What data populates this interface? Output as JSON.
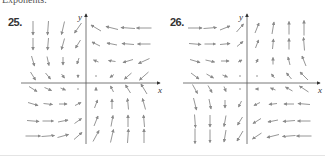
{
  "header": {
    "cut_text": "Exponents."
  },
  "colors": {
    "arrow": "#8a8a8a",
    "axis": "#555555",
    "label": "#333333"
  },
  "chart_data": [
    {
      "type": "vector_field",
      "title": "25.",
      "xlabel": "x",
      "ylabel": "y",
      "origin_px": [
        86,
        83
      ],
      "grid_x_px": [
        33,
        48,
        63,
        78,
        96,
        112,
        128,
        144
      ],
      "grid_y_px": [
        28,
        44,
        61,
        76,
        89,
        104,
        121,
        136
      ],
      "vectors": [
        [
          [
            0,
            14
          ],
          [
            -1,
            14
          ],
          [
            -3,
            13
          ],
          [
            -7,
            10
          ],
          [
            -10,
            -6
          ],
          [
            -12,
            -3
          ],
          [
            -14,
            -1
          ],
          [
            -15,
            0
          ]
        ],
        [
          [
            0,
            12
          ],
          [
            -1,
            12
          ],
          [
            -3,
            11
          ],
          [
            -5,
            8
          ],
          [
            -8,
            -4
          ],
          [
            -10,
            -2
          ],
          [
            -12,
            -1
          ],
          [
            -13,
            0
          ]
        ],
        [
          [
            3,
            10
          ],
          [
            2,
            9
          ],
          [
            0,
            8
          ],
          [
            -2,
            6
          ],
          [
            -5,
            -2
          ],
          [
            -7,
            -1
          ],
          [
            -10,
            3
          ],
          [
            -11,
            5
          ]
        ],
        [
          [
            5,
            8
          ],
          [
            5,
            6
          ],
          [
            3,
            4
          ],
          [
            0,
            3
          ],
          [
            -2,
            0
          ],
          [
            -4,
            3
          ],
          [
            -7,
            6
          ],
          [
            -9,
            8
          ]
        ],
        [
          [
            8,
            5
          ],
          [
            7,
            3
          ],
          [
            5,
            2
          ],
          [
            2,
            0
          ],
          [
            0,
            -3
          ],
          [
            -3,
            -6
          ],
          [
            -5,
            -8
          ],
          [
            -6,
            -10
          ]
        ],
        [
          [
            10,
            3
          ],
          [
            9,
            1
          ],
          [
            8,
            0
          ],
          [
            6,
            -3
          ],
          [
            3,
            -8
          ],
          [
            0,
            -10
          ],
          [
            -1,
            -11
          ],
          [
            -3,
            -11
          ]
        ],
        [
          [
            12,
            1
          ],
          [
            11,
            0
          ],
          [
            10,
            -2
          ],
          [
            7,
            -5
          ],
          [
            4,
            -10
          ],
          [
            2,
            -11
          ],
          [
            0,
            -12
          ],
          [
            -1,
            -12
          ]
        ],
        [
          [
            15,
            0
          ],
          [
            13,
            -1
          ],
          [
            11,
            -3
          ],
          [
            8,
            -7
          ],
          [
            6,
            -11
          ],
          [
            3,
            -13
          ],
          [
            1,
            -14
          ],
          [
            0,
            -14
          ]
        ]
      ]
    },
    {
      "type": "vector_field",
      "title": "26.",
      "xlabel": "x",
      "ylabel": "y",
      "origin_px": [
        247,
        83
      ],
      "grid_x_px": [
        195,
        210,
        225,
        240,
        257,
        273,
        289,
        304
      ],
      "grid_y_px": [
        28,
        44,
        61,
        76,
        89,
        104,
        121,
        136
      ],
      "vectors": [
        [
          [
            14,
            0
          ],
          [
            13,
            -1
          ],
          [
            10,
            -4
          ],
          [
            7,
            -8
          ],
          [
            4,
            -10
          ],
          [
            2,
            -12
          ],
          [
            0,
            -13
          ],
          [
            0,
            -15
          ]
        ],
        [
          [
            12,
            1
          ],
          [
            11,
            0
          ],
          [
            10,
            -1
          ],
          [
            6,
            -5
          ],
          [
            3,
            -8
          ],
          [
            1,
            -10
          ],
          [
            0,
            -11
          ],
          [
            -1,
            -13
          ]
        ],
        [
          [
            10,
            3
          ],
          [
            9,
            2
          ],
          [
            8,
            0
          ],
          [
            4,
            -2
          ],
          [
            2,
            -4
          ],
          [
            0,
            -7
          ],
          [
            -2,
            -8
          ],
          [
            -4,
            -10
          ]
        ],
        [
          [
            8,
            6
          ],
          [
            7,
            4
          ],
          [
            5,
            2
          ],
          [
            2,
            0
          ],
          [
            0,
            -2
          ],
          [
            -3,
            -4
          ],
          [
            -5,
            -6
          ],
          [
            -8,
            -8
          ]
        ],
        [
          [
            5,
            9
          ],
          [
            4,
            7
          ],
          [
            2,
            5
          ],
          [
            0,
            2
          ],
          [
            -3,
            0
          ],
          [
            -5,
            -2
          ],
          [
            -7,
            -4
          ],
          [
            -9,
            -6
          ]
        ],
        [
          [
            3,
            12
          ],
          [
            2,
            10
          ],
          [
            0,
            8
          ],
          [
            -3,
            6
          ],
          [
            -6,
            3
          ],
          [
            -8,
            1
          ],
          [
            -10,
            0
          ],
          [
            -12,
            -1
          ]
        ],
        [
          [
            1,
            13
          ],
          [
            0,
            12
          ],
          [
            -2,
            11
          ],
          [
            -5,
            8
          ],
          [
            -8,
            5
          ],
          [
            -10,
            2
          ],
          [
            -12,
            1
          ],
          [
            -13,
            0
          ]
        ],
        [
          [
            0,
            15
          ],
          [
            0,
            13
          ],
          [
            -2,
            12
          ],
          [
            -6,
            10
          ],
          [
            -9,
            6
          ],
          [
            -12,
            3
          ],
          [
            -13,
            1
          ],
          [
            -15,
            0
          ]
        ]
      ]
    }
  ]
}
